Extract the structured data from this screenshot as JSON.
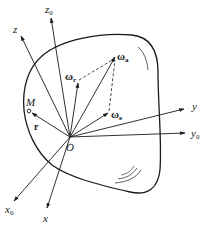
{
  "figure": {
    "type": "rigid body rotation composition diagram",
    "colors": {
      "ink": "#1a1a1a",
      "background": "#ffffff"
    },
    "origin": {
      "label": "O"
    },
    "axes": [
      {
        "name": "z0",
        "label": "z",
        "subscript": "0"
      },
      {
        "name": "z",
        "label": "z",
        "subscript": ""
      },
      {
        "name": "y",
        "label": "y",
        "subscript": ""
      },
      {
        "name": "y0",
        "label": "y",
        "subscript": "0"
      },
      {
        "name": "x0",
        "label": "x",
        "subscript": "0"
      },
      {
        "name": "x",
        "label": "x",
        "subscript": ""
      }
    ],
    "vectors": [
      {
        "name": "omega-a",
        "symbol": "ω",
        "subscript": "a",
        "style": "solid"
      },
      {
        "name": "omega-r",
        "symbol": "ω",
        "subscript": "r",
        "style": "solid"
      },
      {
        "name": "omega-e",
        "symbol": "ω",
        "subscript": "e",
        "style": "solid"
      }
    ],
    "parallelogram_edges": "dashed",
    "point": {
      "label": "M"
    },
    "position_vector": {
      "label": "r"
    }
  }
}
